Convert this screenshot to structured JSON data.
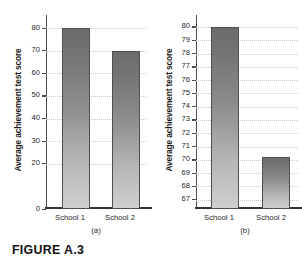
{
  "figure": {
    "caption": "FIGURE A.3"
  },
  "chart_data": [
    {
      "type": "bar",
      "panel_label": "(a)",
      "title": "",
      "xlabel": "",
      "ylabel": "Average achievement test score",
      "categories": [
        "School 1",
        "School 2"
      ],
      "values": [
        80,
        70
      ],
      "ylim": [
        0,
        84
      ],
      "yticks": [
        80,
        70,
        60,
        50,
        40,
        30,
        20,
        0
      ],
      "grid": true,
      "legend": "none"
    },
    {
      "type": "bar",
      "panel_label": "(b)",
      "title": "",
      "xlabel": "",
      "ylabel": "Average achievement test score",
      "categories": [
        "School 1",
        "School 2"
      ],
      "values": [
        80,
        70.2
      ],
      "ylim": [
        66.3,
        80.6
      ],
      "yticks": [
        80,
        79,
        78,
        77,
        76,
        75,
        74,
        73,
        72,
        71,
        70,
        69,
        68,
        67
      ],
      "grid": true,
      "legend": "none"
    }
  ],
  "style": {
    "bar_top_color": "#6b6b6b",
    "bar_bottom_color": "#cfcfcf",
    "bar_border_color": "#4f4f4f",
    "gridline_color": "#c9c9c9",
    "axis_color": "#4d4d4d",
    "text_color": "#1f1f1f"
  }
}
